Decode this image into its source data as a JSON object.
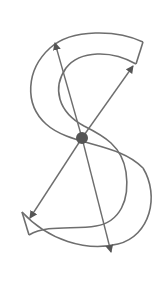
{
  "diagram": {
    "title": "",
    "colors": {
      "background": "#ffffff",
      "stroke": "#6e6e6e",
      "center_point": "#555555"
    },
    "center": {
      "x": 82,
      "y": 138,
      "r": 6
    },
    "shapes": {
      "top_band_outer": "M143,42 C115,28 70,28 52,46 C22,70 22,105 48,125 C75,148 122,140 140,170",
      "top_band_inner": "M136,64 C110,48 78,50 66,68 C50,90 62,118 90,132 C110,142 125,150 128,170",
      "top_end_cap": "M143,42 L136,64",
      "bottom_band_outer": "M22,212 C48,232 100,250 128,238 C158,224 160,180 140,160 C125,145 100,140 82,138",
      "bottom_band_inner": "M29,235 C58,256 110,262 132,242",
      "bottom_end_cap": "M22,212 L29,235"
    },
    "arrows": [
      {
        "name": "arrow-top-left",
        "from": [
          82,
          138
        ],
        "to": [
          55,
          42
        ]
      },
      {
        "name": "arrow-top-right",
        "from": [
          82,
          138
        ],
        "to": [
          133,
          66
        ]
      },
      {
        "name": "arrow-bottom-left",
        "from": [
          82,
          138
        ],
        "to": [
          30,
          218
        ]
      },
      {
        "name": "arrow-bottom-right",
        "from": [
          82,
          138
        ],
        "to": [
          111,
          252
        ]
      }
    ]
  }
}
